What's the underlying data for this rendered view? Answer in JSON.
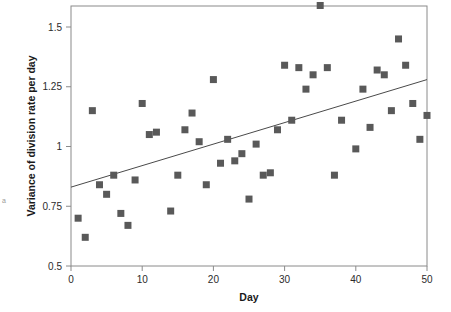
{
  "chart_data": {
    "type": "scatter",
    "title": "",
    "xlabel": "Day",
    "ylabel": "Variance of division rate per day",
    "xlim": [
      0,
      50
    ],
    "ylim": [
      0.5,
      1.6
    ],
    "grid": false,
    "legend": null,
    "xticks": [
      0,
      10,
      20,
      30,
      40,
      50
    ],
    "xtick_labels": [
      "0",
      "10",
      "20",
      "30",
      "40",
      "50"
    ],
    "yticks": [
      0.5,
      0.75,
      1,
      1.25,
      1.5
    ],
    "ytick_labels": [
      "0.5",
      "0.75",
      "1",
      "1.25",
      "1.5"
    ],
    "marker": {
      "shape": "square",
      "color": "#595959",
      "size": 7
    },
    "series": [
      {
        "name": "Variance of division rate per day",
        "x": [
          1,
          2,
          3,
          4,
          5,
          6,
          7,
          8,
          9,
          10,
          11,
          12,
          14,
          15,
          16,
          17,
          18,
          19,
          20,
          21,
          22,
          23,
          24,
          25,
          26,
          27,
          28,
          29,
          30,
          31,
          32,
          33,
          34,
          35,
          36,
          37,
          38,
          40,
          41,
          42,
          43,
          44,
          45,
          46,
          47,
          48,
          49,
          50
        ],
        "y": [
          0.7,
          0.62,
          1.15,
          0.84,
          0.8,
          0.88,
          0.72,
          0.67,
          0.86,
          1.18,
          1.05,
          1.06,
          0.73,
          0.88,
          1.07,
          1.14,
          1.02,
          0.84,
          1.28,
          0.93,
          1.03,
          0.94,
          0.97,
          0.78,
          1.01,
          0.88,
          0.89,
          1.07,
          1.34,
          1.11,
          1.33,
          1.24,
          1.3,
          1.59,
          1.33,
          0.88,
          1.11,
          0.99,
          1.24,
          1.08,
          1.32,
          1.3,
          1.15,
          1.45,
          1.34,
          1.18,
          1.03,
          1.13
        ]
      }
    ],
    "trendline": {
      "name": "linear fit",
      "x_start": 0,
      "y_start": 0.83,
      "x_end": 50,
      "y_end": 1.28,
      "color": "#4a4a4a",
      "width": 1
    },
    "frame": {
      "color": "#8a8a8a",
      "visible_sides": [
        "left",
        "right",
        "top",
        "bottom"
      ]
    },
    "edge_artifact": "a"
  }
}
